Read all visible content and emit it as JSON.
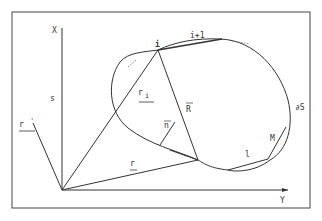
{
  "figure": {
    "axes": {
      "vertical_label": "X",
      "horizontal_label": "Y"
    },
    "labels": {
      "point_i": "i",
      "point_i_plus_1": "i+1",
      "vector_r_i": "r",
      "vector_r_i_sub": "i",
      "vector_R": "R",
      "vector_n": "n",
      "vector_r": "r",
      "vector_r_prime": "r",
      "vector_r_prime_sup": "'",
      "point_M": "M",
      "segment_l": "l",
      "region_s": "s",
      "boundary": "∂S"
    },
    "colors": {
      "line": "#333333",
      "background": "#ffffff"
    }
  }
}
